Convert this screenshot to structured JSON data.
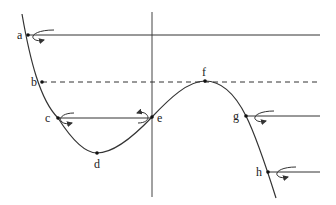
{
  "diagram": {
    "type": "phase-line / stability diagram of cubic curve",
    "colors": {
      "line": "#333333",
      "background": "#ffffff"
    },
    "points": [
      {
        "id": "a",
        "label": "a",
        "x": 28,
        "y": 35
      },
      {
        "id": "b",
        "label": "b",
        "x": 42,
        "y": 82
      },
      {
        "id": "c",
        "label": "c",
        "x": 58,
        "y": 118
      },
      {
        "id": "d",
        "label": "d",
        "x": 97,
        "y": 153
      },
      {
        "id": "e",
        "label": "e",
        "x": 152,
        "y": 117
      },
      {
        "id": "f",
        "label": "f",
        "x": 205,
        "y": 81
      },
      {
        "id": "g",
        "label": "g",
        "x": 246,
        "y": 116
      },
      {
        "id": "h",
        "label": "h",
        "x": 268,
        "y": 172
      }
    ],
    "horizontal_lines": [
      {
        "name": "line-a",
        "style": "solid",
        "y": 35,
        "x1": 28,
        "x2": 320
      },
      {
        "name": "line-b",
        "style": "dashed",
        "y": 82,
        "x1": 42,
        "x2": 320
      },
      {
        "name": "line-c-e",
        "style": "solid",
        "y": 118,
        "x1": 58,
        "x2": 152
      },
      {
        "name": "line-g",
        "style": "solid",
        "y": 116,
        "x1": 246,
        "x2": 320
      },
      {
        "name": "line-h",
        "style": "solid",
        "y": 172,
        "x1": 268,
        "x2": 320
      }
    ],
    "vertical_axis": {
      "x": 152,
      "y1": 12,
      "y2": 197
    }
  }
}
